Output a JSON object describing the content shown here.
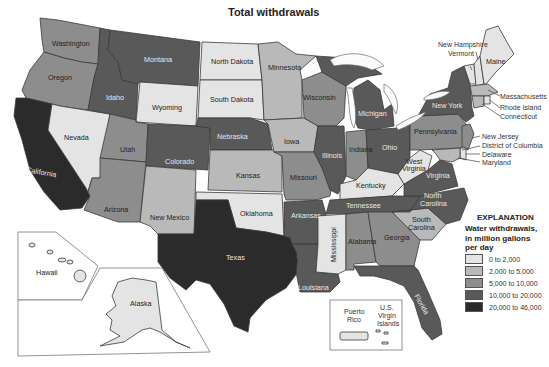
{
  "title": "Total withdrawals",
  "legend": {
    "heading": "EXPLANATION",
    "subtitle_lines": [
      "Water withdrawals,",
      "in million gallons",
      "per day"
    ],
    "classes": [
      {
        "label": "0 to 2,000",
        "color": "#e4e4e4"
      },
      {
        "label": "2,000 to 5,000",
        "color": "#b9b9b9"
      },
      {
        "label": "5,000 to 10,000",
        "color": "#8d8d8d"
      },
      {
        "label": "10,000 to 20,000",
        "color": "#595959"
      },
      {
        "label": "20,000 to 46,000",
        "color": "#2b2b2b"
      }
    ]
  },
  "states": {
    "washington": {
      "label": "Washington",
      "class": 2
    },
    "oregon": {
      "label": "Oregon",
      "class": 2
    },
    "california": {
      "label": "California",
      "class": 4
    },
    "nevada": {
      "label": "Nevada",
      "class": 0
    },
    "idaho": {
      "label": "Idaho",
      "class": 3
    },
    "montana": {
      "label": "Montana",
      "class": 3
    },
    "wyoming": {
      "label": "Wyoming",
      "class": 0
    },
    "utah": {
      "label": "Utah",
      "class": 2
    },
    "arizona": {
      "label": "Arizona",
      "class": 2
    },
    "colorado": {
      "label": "Colorado",
      "class": 3
    },
    "new_mexico": {
      "label": "New Mexico",
      "class": 1
    },
    "north_dakota": {
      "label": "North Dakota",
      "class": 0
    },
    "south_dakota": {
      "label": "South Dakota",
      "class": 0
    },
    "nebraska": {
      "label": "Nebraska",
      "class": 3
    },
    "kansas": {
      "label": "Kansas",
      "class": 1
    },
    "oklahoma": {
      "label": "Oklahoma",
      "class": 0
    },
    "texas": {
      "label": "Texas",
      "class": 4
    },
    "minnesota": {
      "label": "Minnesota",
      "class": 1
    },
    "iowa": {
      "label": "Iowa",
      "class": 1
    },
    "missouri": {
      "label": "Missouri",
      "class": 2
    },
    "arkansas": {
      "label": "Arkansas",
      "class": 3
    },
    "louisiana": {
      "label": "Louisiana",
      "class": 3
    },
    "wisconsin": {
      "label": "Wisconsin",
      "class": 2
    },
    "illinois": {
      "label": "Illinois",
      "class": 3
    },
    "michigan": {
      "label": "Michigan",
      "class": 3
    },
    "indiana": {
      "label": "Indiana",
      "class": 2
    },
    "ohio": {
      "label": "Ohio",
      "class": 3
    },
    "kentucky": {
      "label": "Kentucky",
      "class": 0
    },
    "tennessee": {
      "label": "Tennessee",
      "class": 3
    },
    "mississippi": {
      "label": "Mississippi",
      "class": 0
    },
    "alabama": {
      "label": "Alabama",
      "class": 2
    },
    "georgia": {
      "label": "Georgia",
      "class": 2
    },
    "florida": {
      "label": "Florida",
      "class": 3
    },
    "south_carolina": {
      "label": "South Carolina",
      "class": 1
    },
    "north_carolina": {
      "label": "North Carolina",
      "class": 3
    },
    "virginia": {
      "label": "Virginia",
      "class": 3
    },
    "west_virginia": {
      "label": "West Virginia",
      "class": 0
    },
    "pennsylvania": {
      "label": "Pennsylvania",
      "class": 2
    },
    "new_york": {
      "label": "New York",
      "class": 3
    },
    "maine": {
      "label": "Maine",
      "class": 0
    },
    "new_hampshire": {
      "label": "New Hampshire",
      "class": 0
    },
    "vermont": {
      "label": "Vermont",
      "class": 0
    },
    "massachusetts": {
      "label": "Massachusetts",
      "class": 1
    },
    "rhode_island": {
      "label": "Rhode Island",
      "class": 0
    },
    "connecticut": {
      "label": "Connecticut",
      "class": 1
    },
    "new_jersey": {
      "label": "New Jersey",
      "class": 2
    },
    "delaware": {
      "label": "Delaware",
      "class": 0
    },
    "maryland": {
      "label": "Maryland",
      "class": 1
    },
    "district_of_columbia": {
      "label": "District of Columbia",
      "class": 0
    },
    "alaska": {
      "label": "Alaska",
      "class": 0
    },
    "hawaii": {
      "label": "Hawaii",
      "class": 0
    },
    "puerto_rico": {
      "label": "Puerto Rico",
      "class": 0
    },
    "us_virgin_islands": {
      "label": "U.S. Virgin Islands",
      "class": 0
    }
  },
  "lakes": [
    "Lake Superior",
    "Lake Michigan",
    "Lake Huron",
    "Lake Erie",
    "Lake Ontario"
  ],
  "callouts": {
    "new_hampshire": "New Hampshire",
    "vermont": "Vermont",
    "massachusetts": "Massachusetts",
    "rhode_island": "Rhode Island",
    "connecticut": "Connecticut",
    "new_jersey": "New Jersey",
    "district_of_columbia": "District of Columbia",
    "delaware": "Delaware",
    "maryland": "Maryland"
  },
  "inset_labels": {
    "hawaii": "Hawaii",
    "alaska": "Alaska",
    "puerto_rico_1": "Puerto",
    "puerto_rico_2": "Rico",
    "usvi_1": "U.S.",
    "usvi_2": "Virgin",
    "usvi_3": "Islands"
  },
  "label_two_line": {
    "north_carolina_1": "North",
    "north_carolina_2": "Carolina",
    "south_carolina_1": "South",
    "south_carolina_2": "Carolina",
    "west_virginia_1": "West",
    "west_virginia_2": "Virginia"
  }
}
